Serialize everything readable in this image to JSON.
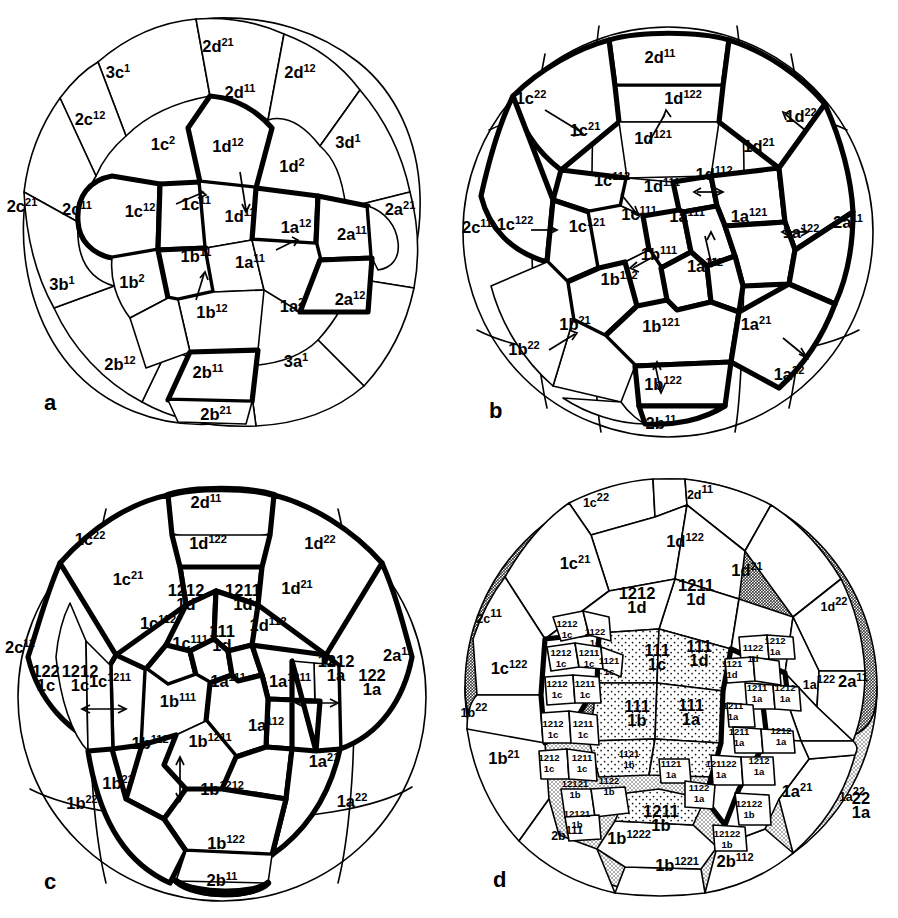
{
  "figure": {
    "background": "#ffffff",
    "ink": "#000000",
    "shading": {
      "dark_gray": "#b4b4b4",
      "light_gray": "#d8d8d8",
      "stipple": "#f0f0f0"
    }
  },
  "panels": [
    {
      "id": "a",
      "letter": "a",
      "name": "panel-a"
    },
    {
      "id": "b",
      "letter": "b",
      "name": "panel-b"
    },
    {
      "id": "c",
      "letter": "c",
      "name": "panel-c"
    },
    {
      "id": "d",
      "letter": "d",
      "name": "panel-d"
    }
  ],
  "panel_a": {
    "letter": "a",
    "cells": [
      {
        "base": "3c",
        "sup": "1",
        "x": 118,
        "y": 78
      },
      {
        "base": "2d",
        "sup": "21",
        "x": 218,
        "y": 52
      },
      {
        "base": "2d",
        "sup": "12",
        "x": 300,
        "y": 78
      },
      {
        "base": "2d",
        "sup": "11",
        "x": 240,
        "y": 98
      },
      {
        "base": "2c",
        "sup": "12",
        "x": 90,
        "y": 125
      },
      {
        "base": "1c",
        "sup": "2",
        "x": 163,
        "y": 150
      },
      {
        "base": "1d",
        "sup": "12",
        "x": 228,
        "y": 152
      },
      {
        "base": "1d",
        "sup": "2",
        "x": 292,
        "y": 172
      },
      {
        "base": "3d",
        "sup": "1",
        "x": 348,
        "y": 148
      },
      {
        "base": "2c",
        "sup": "21",
        "x": 22,
        "y": 212
      },
      {
        "base": "2c",
        "sup": "11",
        "x": 77,
        "y": 215
      },
      {
        "base": "1c",
        "sup": "12",
        "x": 140,
        "y": 217
      },
      {
        "base": "1c",
        "sup": "11",
        "x": 196,
        "y": 210
      },
      {
        "base": "1d",
        "sup": "11",
        "x": 240,
        "y": 222
      },
      {
        "base": "1a",
        "sup": "12",
        "x": 296,
        "y": 233
      },
      {
        "base": "2a",
        "sup": "11",
        "x": 352,
        "y": 240
      },
      {
        "base": "2a",
        "sup": "21",
        "x": 400,
        "y": 215
      },
      {
        "base": "1b",
        "sup": "11",
        "x": 196,
        "y": 262
      },
      {
        "base": "1a",
        "sup": "11",
        "x": 250,
        "y": 268
      },
      {
        "base": "3b",
        "sup": "1",
        "x": 62,
        "y": 290
      },
      {
        "base": "1b",
        "sup": "2",
        "x": 132,
        "y": 288
      },
      {
        "base": "1b",
        "sup": "12",
        "x": 212,
        "y": 318
      },
      {
        "base": "1a",
        "sup": "2",
        "x": 292,
        "y": 312
      },
      {
        "base": "2a",
        "sup": "12",
        "x": 350,
        "y": 305
      },
      {
        "base": "2b",
        "sup": "12",
        "x": 120,
        "y": 370
      },
      {
        "base": "2b",
        "sup": "11",
        "x": 208,
        "y": 378
      },
      {
        "base": "3a",
        "sup": "1",
        "x": 296,
        "y": 367
      },
      {
        "base": "2b",
        "sup": "21",
        "x": 216,
        "y": 420
      }
    ]
  },
  "panel_b": {
    "letter": "b",
    "cells": [
      {
        "base": "2d",
        "sup": "11",
        "x": 211,
        "y": 63
      },
      {
        "base": "1c",
        "sup": "22",
        "x": 82,
        "y": 104
      },
      {
        "base": "1d",
        "sup": "122",
        "x": 234,
        "y": 104
      },
      {
        "base": "1d",
        "sup": "22",
        "x": 352,
        "y": 122
      },
      {
        "base": "1c",
        "sup": "21",
        "x": 136,
        "y": 136
      },
      {
        "base": "1d",
        "sup": "121",
        "x": 204,
        "y": 144
      },
      {
        "base": "1d",
        "sup": "21",
        "x": 310,
        "y": 152
      },
      {
        "base": "1c",
        "sup": "112",
        "x": 163,
        "y": 186
      },
      {
        "base": "1d",
        "sup": "111",
        "x": 213,
        "y": 192
      },
      {
        "base": "1d",
        "sup": "112",
        "x": 265,
        "y": 180
      },
      {
        "base": "2c",
        "sup": "11",
        "x": 28,
        "y": 233
      },
      {
        "base": "1c",
        "sup": "122",
        "x": 66,
        "y": 230
      },
      {
        "base": "1c",
        "sup": "121",
        "x": 138,
        "y": 232
      },
      {
        "base": "1c",
        "sup": "111",
        "x": 190,
        "y": 220
      },
      {
        "base": "1a",
        "sup": "111",
        "x": 238,
        "y": 222
      },
      {
        "base": "1a",
        "sup": "121",
        "x": 300,
        "y": 222
      },
      {
        "base": "1a",
        "sup": "122",
        "x": 352,
        "y": 238
      },
      {
        "base": "2a",
        "sup": "11",
        "x": 399,
        "y": 228
      },
      {
        "base": "1b",
        "sup": "111",
        "x": 210,
        "y": 260
      },
      {
        "base": "1a",
        "sup": "112",
        "x": 256,
        "y": 272
      },
      {
        "base": "1b",
        "sup": "112",
        "x": 170,
        "y": 285
      },
      {
        "base": "1b",
        "sup": "21",
        "x": 126,
        "y": 330
      },
      {
        "base": "1b",
        "sup": "121",
        "x": 212,
        "y": 332
      },
      {
        "base": "1a",
        "sup": "21",
        "x": 307,
        "y": 330
      },
      {
        "base": "1b",
        "sup": "22",
        "x": 75,
        "y": 355
      },
      {
        "base": "1b",
        "sup": "122",
        "x": 214,
        "y": 390
      },
      {
        "base": "1a",
        "sup": "22",
        "x": 340,
        "y": 380
      },
      {
        "base": "2b",
        "sup": "11",
        "x": 212,
        "y": 429
      }
    ]
  },
  "panel_c": {
    "letter": "c",
    "cells_sup": [
      {
        "base": "2d",
        "sup": "11",
        "x": 206,
        "y": 49
      },
      {
        "base": "1c",
        "sup": "22",
        "x": 90,
        "y": 86
      },
      {
        "base": "1d",
        "sup": "122",
        "x": 208,
        "y": 90
      },
      {
        "base": "1d",
        "sup": "22",
        "x": 320,
        "y": 90
      },
      {
        "base": "1c",
        "sup": "21",
        "x": 128,
        "y": 126
      },
      {
        "base": "1d",
        "sup": "21",
        "x": 297,
        "y": 135
      },
      {
        "base": "1c",
        "sup": "112",
        "x": 158,
        "y": 170
      },
      {
        "base": "1d",
        "sup": "112",
        "x": 268,
        "y": 172
      },
      {
        "base": "1c",
        "sup": "111",
        "x": 190,
        "y": 190
      },
      {
        "base": "2c",
        "sup": "11",
        "x": 20,
        "y": 194
      },
      {
        "base": "2a",
        "sup": "11",
        "x": 398,
        "y": 202
      },
      {
        "base": "1c",
        "sup": "1211",
        "x": 110,
        "y": 228
      },
      {
        "base": "1a",
        "sup": "111",
        "x": 228,
        "y": 228
      },
      {
        "base": "1a",
        "sup": "1211",
        "x": 290,
        "y": 228
      },
      {
        "base": "1b",
        "sup": "111",
        "x": 178,
        "y": 248
      },
      {
        "base": "1a",
        "sup": "112",
        "x": 266,
        "y": 272
      },
      {
        "base": "1b",
        "sup": "112",
        "x": 150,
        "y": 290
      },
      {
        "base": "1b",
        "sup": "1211",
        "x": 210,
        "y": 288
      },
      {
        "base": "1a",
        "sup": "21",
        "x": 324,
        "y": 308
      },
      {
        "base": "1b",
        "sup": "21",
        "x": 118,
        "y": 330
      },
      {
        "base": "1b",
        "sup": "1212",
        "x": 222,
        "y": 336
      },
      {
        "base": "1b",
        "sup": "22",
        "x": 82,
        "y": 350
      },
      {
        "base": "1a",
        "sup": "22",
        "x": 352,
        "y": 348
      },
      {
        "base": "1b",
        "sup": "122",
        "x": 226,
        "y": 390
      },
      {
        "base": "2b",
        "sup": "11",
        "x": 222,
        "y": 427
      }
    ],
    "cells_stacked": [
      {
        "sup": "1212",
        "base": "1d",
        "x": 186,
        "y": 137
      },
      {
        "sup": "1211",
        "base": "1d",
        "x": 243,
        "y": 137
      },
      {
        "sup": "111",
        "base": "1d",
        "x": 222,
        "y": 178
      },
      {
        "sup": "122",
        "base": "1c",
        "x": 46,
        "y": 218
      },
      {
        "sup": "1212",
        "base": "1c",
        "x": 80,
        "y": 218
      },
      {
        "sup": "1212",
        "base": "1a",
        "x": 336,
        "y": 208
      },
      {
        "sup": "122",
        "base": "1a",
        "x": 372,
        "y": 222
      }
    ]
  },
  "panel_d": {
    "letter": "d",
    "cells_sup": [
      {
        "base": "1c",
        "sup": "22",
        "x": 147,
        "y": 48,
        "size": "sm"
      },
      {
        "base": "2d",
        "sup": "11",
        "x": 251,
        "y": 40,
        "size": "sm"
      },
      {
        "base": "1c",
        "sup": "21",
        "x": 126,
        "y": 110
      },
      {
        "base": "1d",
        "sup": "122",
        "x": 236,
        "y": 88
      },
      {
        "base": "1d",
        "sup": "21",
        "x": 298,
        "y": 117
      },
      {
        "base": "2c",
        "sup": "11",
        "x": 40,
        "y": 164,
        "size": "sm"
      },
      {
        "base": "1d",
        "sup": "22",
        "x": 385,
        "y": 152,
        "size": "sm"
      },
      {
        "base": "1c",
        "sup": "122",
        "x": 60,
        "y": 215
      },
      {
        "base": "1a",
        "sup": "122",
        "x": 370,
        "y": 230,
        "size": "sm"
      },
      {
        "base": "2a",
        "sup": "11",
        "x": 404,
        "y": 228
      },
      {
        "base": "1b",
        "sup": "22",
        "x": 25,
        "y": 258,
        "size": "sm"
      },
      {
        "base": "1b",
        "sup": "21",
        "x": 55,
        "y": 305
      },
      {
        "base": "1a",
        "sup": "21",
        "x": 348,
        "y": 338
      },
      {
        "base": "1a",
        "sup": "22",
        "x": 403,
        "y": 342,
        "size": "sm"
      },
      {
        "base": "1b",
        "sup": "1222",
        "x": 180,
        "y": 385
      },
      {
        "base": "1b",
        "sup": "1221",
        "x": 228,
        "y": 412
      },
      {
        "base": "2b",
        "sup": "112",
        "x": 286,
        "y": 408
      },
      {
        "base": "2b",
        "sup": "111",
        "x": 118,
        "y": 381,
        "size": "sm"
      }
    ],
    "cells_stacked": [
      {
        "sup": "1212",
        "base": "1d",
        "x": 188,
        "y": 140,
        "size": "lbl"
      },
      {
        "sup": "1211",
        "base": "1d",
        "x": 247,
        "y": 132,
        "size": "lbl"
      },
      {
        "sup": "111",
        "base": "1c",
        "x": 208,
        "y": 197,
        "size": "lbl"
      },
      {
        "sup": "111",
        "base": "1d",
        "x": 250,
        "y": 193,
        "size": "lbl"
      },
      {
        "sup": "111",
        "base": "1b",
        "x": 188,
        "y": 253,
        "size": "lbl"
      },
      {
        "sup": "111",
        "base": "1a",
        "x": 242,
        "y": 252,
        "size": "lbl"
      },
      {
        "sup": "1212",
        "base": "1c",
        "x": 118,
        "y": 168,
        "size": "xs"
      },
      {
        "sup": "1122",
        "base": "1c",
        "x": 146,
        "y": 176,
        "size": "xs"
      },
      {
        "sup": "1212",
        "base": "1c",
        "x": 112,
        "y": 197,
        "size": "xs"
      },
      {
        "sup": "1211",
        "base": "1c",
        "x": 140,
        "y": 197,
        "size": "xs"
      },
      {
        "sup": "1121",
        "base": "1c",
        "x": 160,
        "y": 205,
        "size": "xs"
      },
      {
        "sup": "1212",
        "base": "1c",
        "x": 108,
        "y": 228,
        "size": "xs"
      },
      {
        "sup": "1211",
        "base": "1c",
        "x": 136,
        "y": 228,
        "size": "xs"
      },
      {
        "sup": "1212",
        "base": "1c",
        "x": 104,
        "y": 268,
        "size": "xs"
      },
      {
        "sup": "1211",
        "base": "1c",
        "x": 134,
        "y": 268,
        "size": "xs"
      },
      {
        "sup": "1212",
        "base": "1c",
        "x": 100,
        "y": 302,
        "size": "xs"
      },
      {
        "sup": "1211",
        "base": "1c",
        "x": 133,
        "y": 302,
        "size": "xs"
      },
      {
        "sup": "1121",
        "base": "1b",
        "x": 180,
        "y": 298,
        "size": "xs"
      },
      {
        "sup": "1121",
        "base": "1a",
        "x": 222,
        "y": 308,
        "size": "xs"
      },
      {
        "sup": "12121",
        "base": "1b",
        "x": 126,
        "y": 328,
        "size": "xs"
      },
      {
        "sup": "1122",
        "base": "1b",
        "x": 160,
        "y": 325,
        "size": "xs"
      },
      {
        "sup": "12121",
        "base": "1b",
        "x": 128,
        "y": 358,
        "size": "xs"
      },
      {
        "sup": "1211",
        "base": "1b",
        "x": 212,
        "y": 358,
        "size": "lbl"
      },
      {
        "sup": "1122",
        "base": "1a",
        "x": 250,
        "y": 332,
        "size": "xs"
      },
      {
        "sup": "1121",
        "base": "1d",
        "x": 283,
        "y": 208,
        "size": "xs"
      },
      {
        "sup": "1122",
        "base": "1d",
        "x": 304,
        "y": 192,
        "size": "xs"
      },
      {
        "sup": "1212",
        "base": "1a",
        "x": 326,
        "y": 185,
        "size": "xs"
      },
      {
        "sup": "1211",
        "base": "1a",
        "x": 308,
        "y": 232,
        "size": "xs"
      },
      {
        "sup": "1212",
        "base": "1a",
        "x": 336,
        "y": 232,
        "size": "xs"
      },
      {
        "sup": "1211",
        "base": "1a",
        "x": 284,
        "y": 250,
        "size": "xs"
      },
      {
        "sup": "1211",
        "base": "1a",
        "x": 290,
        "y": 276,
        "size": "xs"
      },
      {
        "sup": "1212",
        "base": "1a",
        "x": 332,
        "y": 275,
        "size": "xs"
      },
      {
        "sup": "121122",
        "base": "1a",
        "x": 272,
        "y": 308,
        "size": "xs"
      },
      {
        "sup": "1212",
        "base": "1a",
        "x": 310,
        "y": 305,
        "size": "xs"
      },
      {
        "sup": "12122",
        "base": "1b",
        "x": 300,
        "y": 348,
        "size": "xs"
      },
      {
        "sup": "12122",
        "base": "1b",
        "x": 278,
        "y": 378,
        "size": "xs"
      },
      {
        "sup": "22",
        "base": "1a",
        "x": 412,
        "y": 345,
        "size": "lbl"
      }
    ]
  }
}
